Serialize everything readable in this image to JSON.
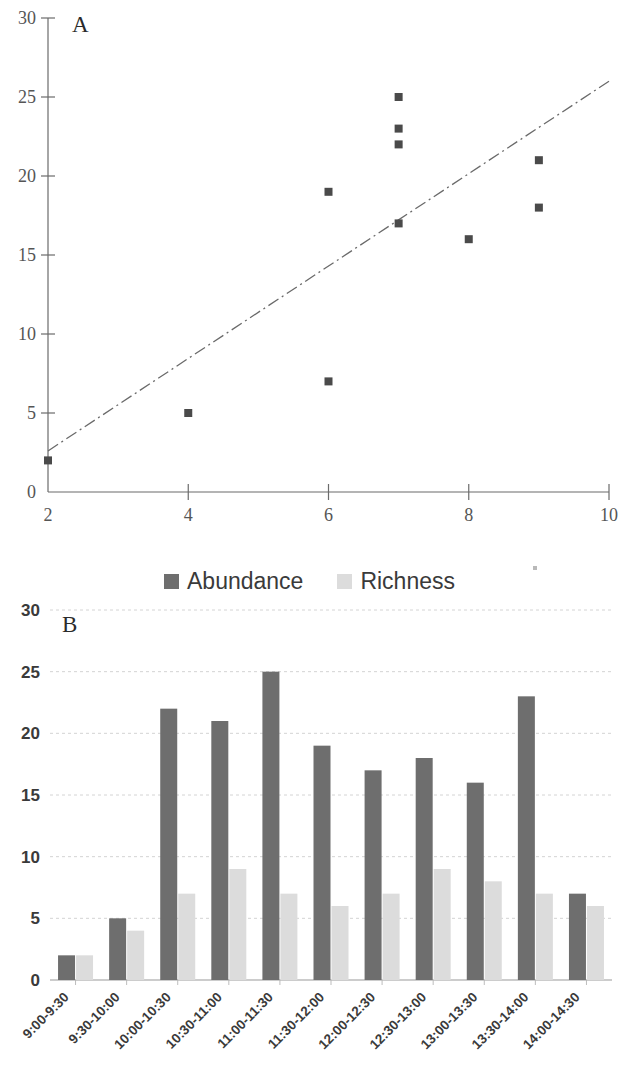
{
  "figure": {
    "panel_a_label": "A",
    "panel_b_label": "B"
  },
  "legend": {
    "items": [
      {
        "label": "Abundance",
        "color": "#6e6e6e"
      },
      {
        "label": "Richness",
        "color": "#dcdcdc"
      }
    ]
  },
  "chart_data": [
    {
      "type": "scatter",
      "title": "A",
      "xlabel": "",
      "ylabel": "",
      "xlim": [
        2,
        10
      ],
      "ylim": [
        0,
        30
      ],
      "xticks": [
        2,
        4,
        6,
        8,
        10
      ],
      "yticks": [
        0,
        5,
        10,
        15,
        20,
        25,
        30
      ],
      "grid": false,
      "marker_color": "#4a4a4a",
      "series": [
        {
          "name": "observations",
          "points": [
            {
              "x": 2,
              "y": 2
            },
            {
              "x": 4,
              "y": 5
            },
            {
              "x": 6,
              "y": 7
            },
            {
              "x": 6,
              "y": 19
            },
            {
              "x": 7,
              "y": 17
            },
            {
              "x": 7,
              "y": 22
            },
            {
              "x": 7,
              "y": 23
            },
            {
              "x": 7,
              "y": 25
            },
            {
              "x": 8,
              "y": 16
            },
            {
              "x": 9,
              "y": 18
            },
            {
              "x": 9,
              "y": 21
            }
          ]
        }
      ],
      "trendline": {
        "style": "dash-dot",
        "color": "#6a6a6a",
        "x_start": 2,
        "y_start": 2.6,
        "x_end": 10,
        "y_end": 26.0
      }
    },
    {
      "type": "bar",
      "title": "B",
      "xlabel": "",
      "ylabel": "",
      "ylim": [
        0,
        30
      ],
      "yticks": [
        0,
        5,
        10,
        15,
        20,
        25,
        30
      ],
      "grid": true,
      "legend_position": "top-center",
      "categories": [
        "9:00-9:30",
        "9:30-10:00",
        "10:00-10:30",
        "10:30-11:00",
        "11:00-11:30",
        "11:30-12:00",
        "12:00-12:30",
        "12:30-13:00",
        "13:00-13:30",
        "13:30-14:00",
        "14:00-14:30"
      ],
      "series": [
        {
          "name": "Abundance",
          "color": "#6e6e6e",
          "values": [
            2,
            5,
            22,
            21,
            25,
            19,
            17,
            18,
            16,
            23,
            7
          ]
        },
        {
          "name": "Richness",
          "color": "#dcdcdc",
          "values": [
            2,
            4,
            7,
            9,
            7,
            6,
            7,
            9,
            8,
            7,
            6
          ]
        }
      ]
    }
  ]
}
